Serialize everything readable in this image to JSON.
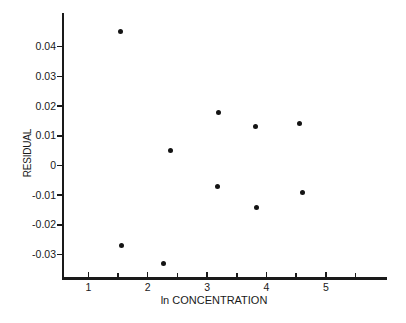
{
  "figure": {
    "background": "#ffffff",
    "axis_color": "#1a1a1a",
    "marker_color": "#141414"
  },
  "chart_data": {
    "type": "scatter",
    "title": "",
    "xlabel": "ln CONCENTRATION",
    "ylabel": "RESIDUAL",
    "grid": false,
    "legend": "none",
    "marker": "filled-dot",
    "x_axis": {
      "range": [
        0.55,
        6.0
      ],
      "major_ticks": [
        1,
        2,
        3,
        4,
        5
      ],
      "minor_ticks": [
        1.5,
        2.5,
        3.5,
        4.5,
        5.5
      ]
    },
    "y_axis": {
      "range": [
        -0.0385,
        0.0513
      ],
      "ticks": [
        {
          "value": 0.04,
          "label": "0.04"
        },
        {
          "value": 0.03,
          "label": "0.03"
        },
        {
          "value": 0.02,
          "label": "0.02"
        },
        {
          "value": 0.01,
          "label": "0.01"
        },
        {
          "value": 0,
          "label": "0"
        },
        {
          "value": -0.01,
          "label": "-0.01"
        },
        {
          "value": -0.02,
          "label": "-0.02"
        },
        {
          "value": -0.03,
          "label": "-0.03"
        }
      ]
    },
    "points": [
      {
        "x": 1.55,
        "y": 0.045
      },
      {
        "x": 2.39,
        "y": 0.005
      },
      {
        "x": 3.2,
        "y": 0.018
      },
      {
        "x": 3.82,
        "y": 0.013
      },
      {
        "x": 4.56,
        "y": 0.014
      },
      {
        "x": 3.18,
        "y": -0.007
      },
      {
        "x": 3.84,
        "y": -0.014
      },
      {
        "x": 4.6,
        "y": -0.009
      },
      {
        "x": 1.56,
        "y": -0.027
      },
      {
        "x": 2.27,
        "y": -0.033
      }
    ]
  }
}
